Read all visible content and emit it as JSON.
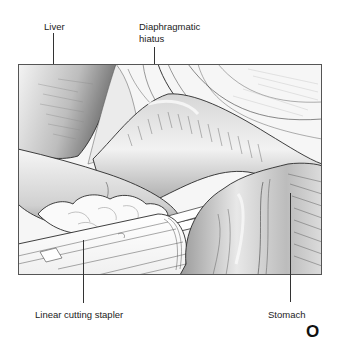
{
  "figure": {
    "panel_letter": "O",
    "frame": {
      "x": 18,
      "y": 64,
      "width": 304,
      "height": 211,
      "border_color": "#555555"
    }
  },
  "labels": {
    "liver": "Liver",
    "diaphragmatic_hiatus_line1": "Diaphragmatic",
    "diaphragmatic_hiatus_line2": "hiatus",
    "linear_cutting_stapler": "Linear cutting stapler",
    "stomach": "Stomach"
  },
  "colors": {
    "line_art": "#2a2a2a",
    "shade_dark": "#8a8a8a",
    "shade_mid": "#c4c4c4",
    "shade_light": "#ececec",
    "background": "#ffffff"
  }
}
